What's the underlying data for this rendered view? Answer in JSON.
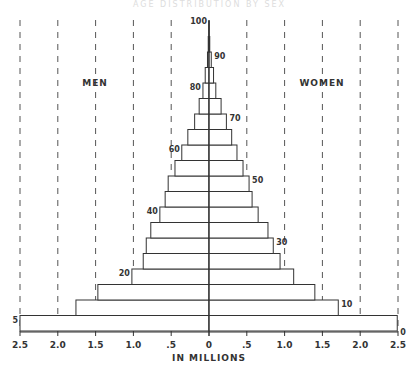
{
  "title": "AGE DISTRIBUTION BY SEX",
  "side_labels": {
    "left": "MEN",
    "right": "WOMEN"
  },
  "xlabel": "IN MILLIONS",
  "x_ticks": [
    "2.5",
    "2.0",
    "1.5",
    "1.0",
    ".5",
    "0",
    ".5",
    "1.0",
    "1.5",
    "2.0",
    "2.5"
  ],
  "age_labels_left": [
    "5",
    "20",
    "40",
    "60",
    "80"
  ],
  "age_labels_right": [
    "0",
    "10",
    "30",
    "50",
    "70",
    "90"
  ],
  "age_label_top": "100",
  "chart_data": {
    "type": "bar",
    "subtype": "population-pyramid",
    "title": "",
    "xlabel": "IN MILLIONS",
    "ylabel": "Age",
    "xlim": [
      -2.5,
      2.5
    ],
    "grid": "vertical dashed lines at every 0.5 million",
    "categories": [
      "0-4",
      "5-9",
      "10-14",
      "15-19",
      "20-24",
      "25-29",
      "30-34",
      "35-39",
      "40-44",
      "45-49",
      "50-54",
      "55-59",
      "60-64",
      "65-69",
      "70-74",
      "75-79",
      "80-84",
      "85-89",
      "90-94",
      "95-99"
    ],
    "series": [
      {
        "name": "MEN",
        "values": [
          2.5,
          1.76,
          1.47,
          1.02,
          0.87,
          0.83,
          0.77,
          0.65,
          0.58,
          0.54,
          0.45,
          0.36,
          0.28,
          0.19,
          0.13,
          0.08,
          0.05,
          0.02,
          0.01,
          0.003
        ]
      },
      {
        "name": "WOMEN",
        "values": [
          2.49,
          1.71,
          1.4,
          1.12,
          0.94,
          0.85,
          0.78,
          0.65,
          0.57,
          0.53,
          0.45,
          0.37,
          0.3,
          0.23,
          0.16,
          0.09,
          0.06,
          0.03,
          0.01,
          0.003
        ]
      }
    ],
    "age_tick_labels": [
      "0",
      "5",
      "10",
      "20",
      "30",
      "40",
      "50",
      "60",
      "70",
      "80",
      "90",
      "100"
    ]
  }
}
